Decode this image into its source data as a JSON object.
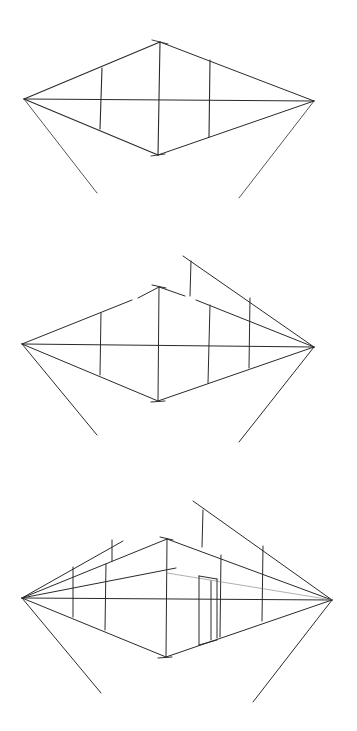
{
  "colors": {
    "ink": "#2a2a2a",
    "light_ink": "#7a7a7a",
    "paper": "#ffffff"
  },
  "panels": [
    {
      "name": "panel-1-basic-box",
      "lines": [
        [
          24,
          99,
          160,
          42,
          1.1
        ],
        [
          160,
          42,
          314,
          101,
          1.0
        ],
        [
          24,
          99,
          158,
          155,
          1.1
        ],
        [
          158,
          155,
          314,
          101,
          1.0
        ],
        [
          24,
          99,
          314,
          101,
          1.0
        ],
        [
          160,
          42,
          158,
          155,
          1.1
        ],
        [
          102,
          68,
          100,
          129,
          1.1
        ],
        [
          210,
          60,
          209,
          137,
          1.1
        ],
        [
          24,
          99,
          97,
          193,
          0.8
        ],
        [
          314,
          101,
          239,
          198,
          0.8
        ],
        [
          152,
          40,
          168,
          44,
          0.9
        ],
        [
          151,
          156,
          165,
          154,
          0.9
        ]
      ]
    },
    {
      "name": "panel-2-extended-roof",
      "lines": [
        [
          22,
          344,
          132,
          300
        ],
        [
          138,
          298,
          159,
          287
        ],
        [
          159,
          287,
          185,
          296
        ],
        [
          196,
          300,
          314,
          347
        ],
        [
          22,
          344,
          158,
          401
        ],
        [
          158,
          401,
          314,
          347
        ],
        [
          22,
          344,
          314,
          347
        ],
        [
          159,
          287,
          158,
          401
        ],
        [
          101,
          313,
          100,
          375
        ],
        [
          210,
          305,
          208,
          383
        ],
        [
          250,
          298,
          249,
          368
        ],
        [
          191,
          261,
          190,
          296
        ],
        [
          183,
          256,
          314,
          347
        ],
        [
          22,
          344,
          97,
          435
        ],
        [
          314,
          347,
          239,
          442
        ],
        [
          152,
          285,
          166,
          288
        ],
        [
          151,
          402,
          165,
          401
        ]
      ]
    },
    {
      "name": "panel-3-detailed-building",
      "lines": [
        [
          22,
          598,
          123,
          541
        ],
        [
          22,
          598,
          167,
          539
        ],
        [
          22,
          598,
          176,
          568
        ],
        [
          22,
          598,
          332,
          600
        ],
        [
          22,
          598,
          166,
          657
        ],
        [
          167,
          539,
          332,
          600
        ],
        [
          166,
          657,
          332,
          600
        ],
        [
          167,
          539,
          166,
          657
        ],
        [
          73,
          567,
          73,
          617
        ],
        [
          106,
          564,
          105,
          630
        ],
        [
          112,
          540,
          112,
          561
        ],
        [
          203,
          510,
          202,
          547
        ],
        [
          193,
          501,
          332,
          600
        ],
        [
          221,
          555,
          220,
          637
        ],
        [
          263,
          546,
          262,
          621
        ],
        [
          167,
          573,
          332,
          600,
          0.6
        ],
        [
          199,
          576,
          199,
          645
        ],
        [
          199,
          576,
          217,
          579
        ],
        [
          211,
          581,
          211,
          640
        ],
        [
          217,
          579,
          217,
          638
        ],
        [
          199,
          645,
          217,
          640
        ],
        [
          22,
          598,
          101,
          693
        ],
        [
          332,
          600,
          253,
          702
        ],
        [
          160,
          537,
          173,
          540
        ],
        [
          158,
          658,
          172,
          657
        ]
      ]
    }
  ]
}
